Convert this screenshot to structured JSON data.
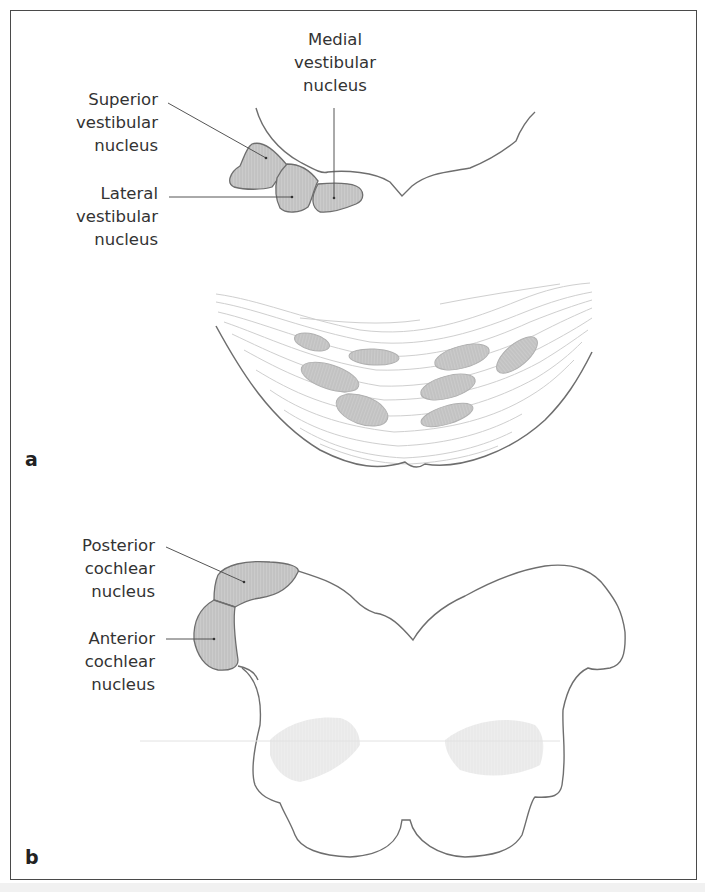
{
  "figure": {
    "panels": [
      {
        "id": "a",
        "letter": "a",
        "labels": {
          "medial": "Medial\nvestibular\nnucleus",
          "superior": "Superior\nvestibular\nnucleus",
          "lateral": "Lateral\nvestibular\nnucleus"
        }
      },
      {
        "id": "b",
        "letter": "b",
        "labels": {
          "posterior": "Posterior\ncochlear\nnucleus",
          "anterior": "Anterior\ncochlear\nnucleus"
        }
      }
    ],
    "colors": {
      "outline": "#6e6e6e",
      "nucleus_fill": "#c8c8c8",
      "fiber": "#c9c9c9",
      "frame": "#4a4a4a"
    }
  }
}
